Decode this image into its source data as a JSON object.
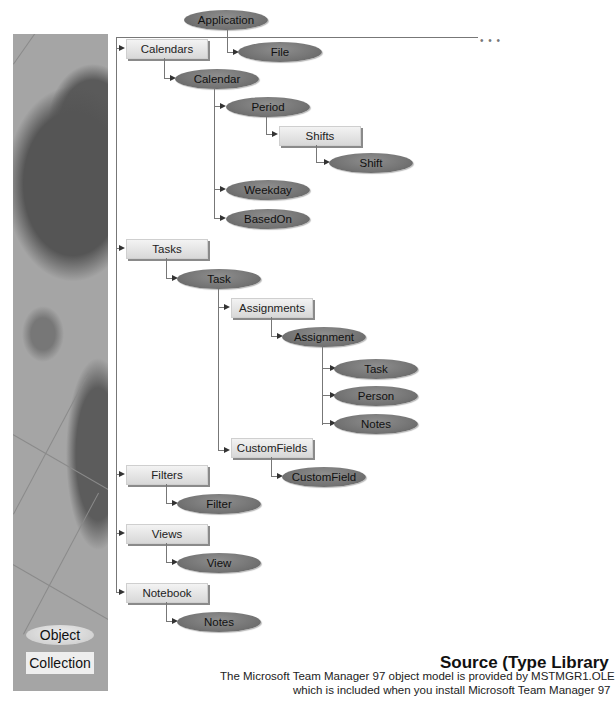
{
  "diagram": {
    "root": "Application",
    "more_indicator": "• • •",
    "nodes": {
      "application": "Application",
      "file": "File",
      "calendars": "Calendars",
      "calendar": "Calendar",
      "period": "Period",
      "shifts": "Shifts",
      "shift": "Shift",
      "weekday": "Weekday",
      "basedon": "BasedOn",
      "tasks": "Tasks",
      "task": "Task",
      "assignments": "Assignments",
      "assignment": "Assignment",
      "assignment_task": "Task",
      "person": "Person",
      "assignment_notes": "Notes",
      "customfields": "CustomFields",
      "customfield": "CustomField",
      "filters": "Filters",
      "filter": "Filter",
      "views": "Views",
      "view": "View",
      "notebook": "Notebook",
      "notebook_notes": "Notes"
    },
    "colors": {
      "object_fill": "#747474",
      "collection_fill": "#e4e4e4",
      "connector": "#777777"
    }
  },
  "legend": {
    "object": "Object",
    "collection": "Collection"
  },
  "source": {
    "title": "Source (Type Library",
    "line1": "The Microsoft Team Manager 97 object model is provided by MSTMGR1.OLE",
    "line2": "which is included when you install Microsoft Team Manager 97"
  }
}
